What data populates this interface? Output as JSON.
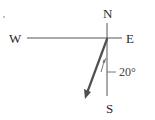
{
  "diagram": {
    "type": "compass-vector",
    "labels": {
      "north": "N",
      "east": "E",
      "west": "W",
      "south": "S"
    },
    "angle": {
      "value": 20,
      "text": "20°",
      "reference": "south",
      "direction": "west of south"
    },
    "colors": {
      "axis": "#555555",
      "arrow": "#505050",
      "text": "#2a2a2a"
    }
  }
}
